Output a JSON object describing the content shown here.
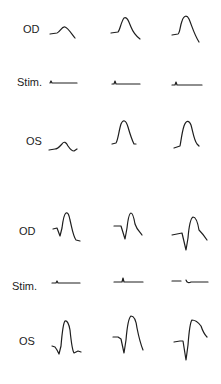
{
  "figure": {
    "panels": [
      {
        "id": "panel-1",
        "rows": [
          {
            "label": "OD",
            "kind": "response"
          },
          {
            "label": "Stim.",
            "kind": "stimulus"
          },
          {
            "label": "OS",
            "kind": "response"
          }
        ],
        "columns": 3
      },
      {
        "id": "panel-2",
        "rows": [
          {
            "label": "OD",
            "kind": "response"
          },
          {
            "label": "Stim.",
            "kind": "stimulus"
          },
          {
            "label": "OS",
            "kind": "response"
          }
        ],
        "columns": 3
      }
    ],
    "trace_color": "#1e1e1e",
    "background": "#ffffff"
  }
}
